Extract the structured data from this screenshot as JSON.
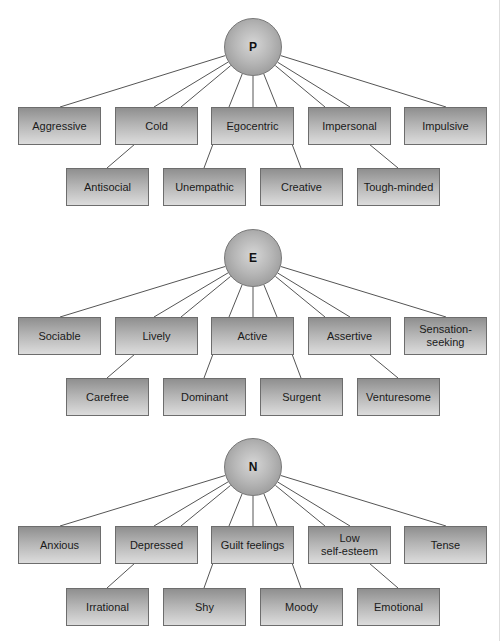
{
  "diagram": {
    "type": "hierarchy",
    "colors": {
      "box_top": "#8f8f8f",
      "box_bottom": "#dcdcdc",
      "box_border": "#6d6d6d",
      "line": "#555555",
      "circle_light": "#d6d6d6",
      "circle_dark": "#8a8a8a"
    },
    "sections": [
      {
        "factor": "P",
        "row1": [
          "Aggressive",
          "Cold",
          "Egocentric",
          "Impersonal",
          "Impulsive"
        ],
        "row2": [
          "Antisocial",
          "Unempathic",
          "Creative",
          "Tough-minded"
        ]
      },
      {
        "factor": "E",
        "row1": [
          "Sociable",
          "Lively",
          "Active",
          "Assertive",
          "Sensation-\nseeking"
        ],
        "row2": [
          "Carefree",
          "Dominant",
          "Surgent",
          "Venturesome"
        ]
      },
      {
        "factor": "N",
        "row1": [
          "Anxious",
          "Depressed",
          "Guilt feelings",
          "Low\nself-esteem",
          "Tense"
        ],
        "row2": [
          "Irrational",
          "Shy",
          "Moody",
          "Emotional"
        ]
      }
    ]
  }
}
